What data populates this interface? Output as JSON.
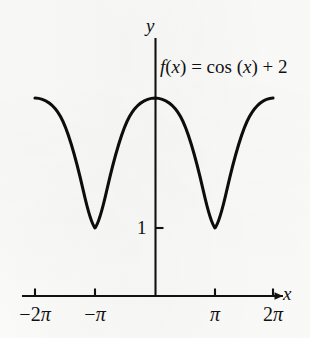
{
  "figure": {
    "background_color": "#fdfdfc",
    "ink_color": "#111111",
    "curve_color": "#0d0d0d"
  },
  "axes": {
    "y_axis_label": "y",
    "x_axis_label": "x",
    "y_tick_label": "1"
  },
  "function_label": {
    "lhs_f": "f",
    "lhs_open": "(",
    "lhs_var": "x",
    "lhs_close": ")",
    "equals": "=",
    "operator": "cos",
    "arg_open": "(",
    "arg_var": "x",
    "arg_close": ")",
    "plus": "+",
    "constant": "2",
    "full_text": "f(x) = cos (x) + 2"
  },
  "chart_data": {
    "type": "line",
    "title": "",
    "subtitle": "",
    "expression": "f(x) = cos (x) + 2",
    "xlabel": "x",
    "ylabel": "y",
    "grid": false,
    "legend": null,
    "xlim": [
      -6.8067,
      7.0686
    ],
    "ylim": [
      -0.55,
      3.85
    ],
    "xtick_labels": [
      "-2π",
      "-π",
      "π",
      "2π"
    ],
    "xtick_values": [
      -6.2832,
      -3.1416,
      3.1416,
      6.2832
    ],
    "ytick_labels": [
      "1"
    ],
    "ytick_values": [
      1
    ],
    "amplitude": 1,
    "vertical_shift": 2,
    "period": 6.2832,
    "maxima_y": 3,
    "minima_y": 1,
    "maxima_x": [
      -6.2832,
      0,
      6.2832
    ],
    "minima_x": [
      -3.1416,
      3.1416
    ],
    "series": [
      {
        "name": "f(x) = cos (x) + 2",
        "x": [
          -6.2832,
          -5.8905,
          -5.4978,
          -5.1051,
          -4.7124,
          -4.3197,
          -3.927,
          -3.5343,
          -3.1416,
          -2.7489,
          -2.3562,
          -1.9635,
          -1.5708,
          -1.1781,
          -0.7854,
          -0.3927,
          0,
          0.3927,
          0.7854,
          1.1781,
          1.5708,
          1.9635,
          2.3562,
          2.7489,
          3.1416,
          3.5343,
          3.927,
          4.3197,
          4.7124,
          5.1051,
          5.4978,
          5.8905,
          6.2832
        ],
        "y": [
          3,
          2.9239,
          2.7071,
          2.3827,
          2,
          1.6173,
          1.2929,
          1.0761,
          1,
          1.0761,
          1.2929,
          1.6173,
          2,
          2.3827,
          2.7071,
          2.9239,
          3,
          2.9239,
          2.7071,
          2.3827,
          2,
          1.6173,
          1.2929,
          1.0761,
          1,
          1.0761,
          1.2929,
          1.6173,
          2,
          2.3827,
          2.7071,
          2.9239,
          3
        ]
      }
    ]
  }
}
